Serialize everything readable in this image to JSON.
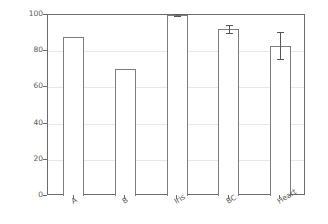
{
  "chart_data": {
    "type": "bar",
    "title": "",
    "xlabel": "",
    "ylabel": "% performance",
    "categories": [
      "A",
      "B",
      "Iris",
      "BC",
      "Heart"
    ],
    "values": [
      87.8,
      70.1,
      99.9,
      92.2,
      83.1
    ],
    "errors": [
      0,
      0,
      0.6,
      2.0,
      7.5
    ],
    "ylim": [
      0,
      100
    ],
    "yticks": [
      0,
      20,
      40,
      60,
      80,
      100
    ],
    "ytick_labels": [
      "0",
      "20",
      "40",
      "60",
      "80",
      "100"
    ],
    "grid": true,
    "legend": "none",
    "bar_facecolor": "#ffffff",
    "bar_edgecolor": "#7d7d7d",
    "errorbar_color": "#555555",
    "axis_color": "#6b6b6b",
    "grid_color": "#e8e8e8",
    "background": "#ffffff",
    "xtick_rotation_deg": -32
  }
}
